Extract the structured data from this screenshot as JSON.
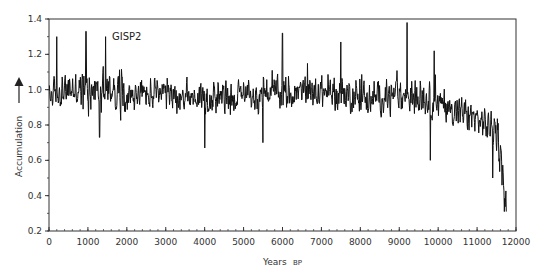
{
  "chart_data": {
    "type": "line",
    "title": "",
    "annotation": "GISP2",
    "xlabel": "Years",
    "xlabel_suffix": "BP",
    "ylabel": "Accumulation",
    "ylabel_arrow": "up",
    "xlim": [
      0,
      12000
    ],
    "ylim": [
      0.2,
      1.4
    ],
    "x_ticks": [
      0,
      1000,
      2000,
      3000,
      4000,
      5000,
      6000,
      7000,
      8000,
      9000,
      10000,
      11000,
      12000
    ],
    "x_tick_labels": [
      "0",
      "1000",
      "2000",
      "3000",
      "4000",
      "5000",
      "6000",
      "7000",
      "8000",
      "9000",
      "10000",
      "11000",
      "12000"
    ],
    "x_minor_step": 200,
    "y_ticks": [
      0.2,
      0.4,
      0.6,
      0.8,
      1.0,
      1.2,
      1.4
    ],
    "y_tick_labels": [
      "0.2",
      "0.4",
      "0.6",
      "0.8",
      "1.0",
      "1.2",
      "1.4"
    ],
    "y_minor_step": 0.1,
    "grid": false,
    "legend": "none",
    "series": [
      {
        "name": "GISP2 accumulation",
        "color": "#111111",
        "trend": {
          "x": [
            0,
            500,
            1000,
            1500,
            2000,
            3000,
            4000,
            5000,
            6000,
            7000,
            8000,
            8500,
            9000,
            9500,
            10000,
            10500,
            11000,
            11400,
            11550,
            11650,
            11750
          ],
          "y": [
            0.97,
            1.0,
            1.0,
            1.0,
            0.97,
            0.97,
            0.96,
            0.96,
            0.98,
            0.99,
            0.96,
            0.95,
            0.97,
            0.96,
            0.92,
            0.88,
            0.83,
            0.78,
            0.72,
            0.55,
            0.33
          ]
        },
        "noise_amplitude": 0.08,
        "notable_peaks": [
          {
            "x": 200,
            "y": 1.3
          },
          {
            "x": 950,
            "y": 1.33
          },
          {
            "x": 1450,
            "y": 1.3
          },
          {
            "x": 6000,
            "y": 1.32
          },
          {
            "x": 7500,
            "y": 1.27
          },
          {
            "x": 9200,
            "y": 1.38
          },
          {
            "x": 9900,
            "y": 1.22
          }
        ],
        "notable_troughs": [
          {
            "x": 1300,
            "y": 0.73
          },
          {
            "x": 4000,
            "y": 0.67
          },
          {
            "x": 5500,
            "y": 0.7
          },
          {
            "x": 9800,
            "y": 0.6
          },
          {
            "x": 11400,
            "y": 0.5
          },
          {
            "x": 11700,
            "y": 0.31
          }
        ],
        "n_points": 1180
      }
    ]
  }
}
